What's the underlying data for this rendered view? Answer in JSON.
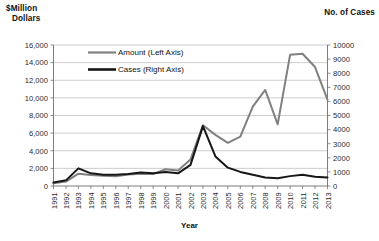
{
  "labels": {
    "left_axis_title_line1": "$Million",
    "left_axis_title_line2": "Dollars",
    "right_axis_title": "No. of Cases",
    "x_axis_title": "Year"
  },
  "legend": {
    "items": [
      {
        "label": "Amount (Left Axis)",
        "color": "#808080"
      },
      {
        "label": "Cases (Right Axis)",
        "color": "#161616"
      }
    ]
  },
  "colors": {
    "amount_line": "#808080",
    "cases_line": "#161616",
    "gridline": "#b9b9b9",
    "axis": "#6e6e6e",
    "background": "#ffffff"
  },
  "chart_data": {
    "type": "line",
    "title": "",
    "subtitle": "",
    "xlabel": "Year",
    "ylabel": "$Million Dollars",
    "y2label": "No. of Cases",
    "grid": true,
    "legend_position": "top-center-inside",
    "categories": [
      "1991",
      "1992",
      "1993",
      "1994",
      "1995",
      "1996",
      "1997",
      "1998",
      "1999",
      "2000",
      "2001",
      "2002",
      "2003",
      "2004",
      "2005",
      "2006",
      "2007",
      "2008",
      "2009",
      "2010",
      "2011",
      "2012",
      "2013"
    ],
    "x_tick_labels": [
      "1991",
      "1992",
      "1993",
      "1994",
      "1995",
      "1996",
      "1997",
      "1998",
      "1999",
      "2000",
      "2001",
      "2002",
      "2003",
      "2004",
      "2005",
      "2006",
      "2007",
      "2008",
      "2009",
      "2010",
      "2011",
      "2012",
      "2013"
    ],
    "ylim": [
      0,
      16000
    ],
    "y_ticks": [
      0,
      2000,
      4000,
      6000,
      8000,
      10000,
      12000,
      14000,
      16000
    ],
    "y_tick_labels": [
      "0",
      "2,000",
      "4,000",
      "6,000",
      "8,000",
      "10,000",
      "12,000",
      "14,000",
      "16,000"
    ],
    "y2lim": [
      0,
      10000
    ],
    "y2_ticks": [
      0,
      1000,
      2000,
      3000,
      4000,
      5000,
      6000,
      7000,
      8000,
      9000,
      10000
    ],
    "y2_tick_labels": [
      "0",
      "1000",
      "2000",
      "3000",
      "4000",
      "5000",
      "6000",
      "7000",
      "8000",
      "9000",
      "10000"
    ],
    "series": [
      {
        "name": "Amount (Left Axis)",
        "axis": "left",
        "color": "#808080",
        "values": [
          300,
          500,
          1400,
          1250,
          1150,
          1100,
          1300,
          1400,
          1350,
          1900,
          1750,
          3000,
          6900,
          5800,
          4900,
          5600,
          9000,
          10900,
          7000,
          14900,
          15000,
          13500,
          9800
        ]
      },
      {
        "name": "Cases (Right Axis)",
        "axis": "right",
        "color": "#161616",
        "values": [
          250,
          400,
          1250,
          900,
          800,
          800,
          850,
          950,
          900,
          1000,
          900,
          1500,
          4250,
          2100,
          1300,
          1000,
          800,
          600,
          550,
          700,
          800,
          650,
          600
        ]
      }
    ]
  }
}
